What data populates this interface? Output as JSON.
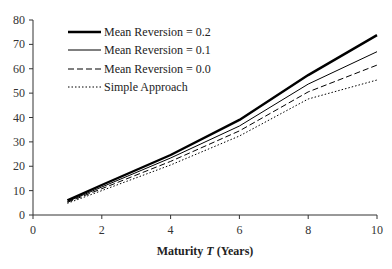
{
  "chart_data": {
    "type": "line",
    "title": "",
    "xlabel": "Maturity T (Years)",
    "xlabel_parts": {
      "pre": "Maturity ",
      "italic": "T",
      "post": " (Years)"
    },
    "ylabel": "",
    "xlim": [
      0,
      10
    ],
    "ylim": [
      0,
      80
    ],
    "x_ticks": [
      0,
      2,
      4,
      6,
      8,
      10
    ],
    "y_ticks": [
      0,
      10,
      20,
      30,
      40,
      50,
      60,
      70,
      80
    ],
    "grid": false,
    "legend_position": "upper-left",
    "x": [
      1,
      2,
      4,
      6,
      8,
      10
    ],
    "series": [
      {
        "name": "Mean Reversion = 0.2",
        "style": "thick-solid",
        "values": [
          6.0,
          12.3,
          24.6,
          39.0,
          57.4,
          73.8
        ]
      },
      {
        "name": "Mean Reversion = 0.1",
        "style": "thin-solid",
        "values": [
          5.5,
          11.5,
          23.4,
          36.5,
          53.7,
          67.0
        ]
      },
      {
        "name": "Mean Reversion = 0.0",
        "style": "dashed",
        "values": [
          5.2,
          10.8,
          22.0,
          34.5,
          50.5,
          61.5
        ]
      },
      {
        "name": "Simple Approach",
        "style": "dotted",
        "values": [
          4.8,
          10.0,
          20.5,
          32.4,
          47.6,
          55.4
        ]
      }
    ]
  },
  "colors": {
    "line": "#000000",
    "axis": "#333333"
  }
}
